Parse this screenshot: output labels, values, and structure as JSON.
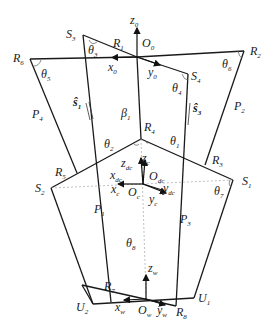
{
  "figure": {
    "type": "mechanism-diagram",
    "labels": {
      "z0": {
        "base": "z",
        "sub": "0"
      },
      "x0": {
        "base": "x",
        "sub": "0"
      },
      "y0": {
        "base": "y",
        "sub": "0"
      },
      "O0": {
        "base": "O",
        "sub": "0"
      },
      "R1": {
        "base": "R",
        "sub": "1"
      },
      "R2": {
        "base": "R",
        "sub": "2"
      },
      "R3": {
        "base": "R",
        "sub": "3"
      },
      "R4": {
        "base": "R",
        "sub": "4"
      },
      "R5": {
        "base": "R",
        "sub": "5"
      },
      "R6": {
        "base": "R",
        "sub": "6"
      },
      "R7": {
        "base": "R",
        "sub": "7"
      },
      "R8": {
        "base": "R",
        "sub": "8"
      },
      "S1": {
        "base": "S",
        "sub": "1"
      },
      "S2": {
        "base": "S",
        "sub": "2"
      },
      "S3": {
        "base": "S",
        "sub": "3"
      },
      "S4": {
        "base": "S",
        "sub": "4"
      },
      "P1": {
        "base": "P",
        "sub": "1"
      },
      "P2": {
        "base": "P",
        "sub": "2"
      },
      "P3": {
        "base": "P",
        "sub": "3"
      },
      "P4": {
        "base": "P",
        "sub": "4"
      },
      "U1": {
        "base": "U",
        "sub": "1"
      },
      "U2": {
        "base": "U",
        "sub": "2"
      },
      "theta1": {
        "base": "θ",
        "sub": "1"
      },
      "theta2": {
        "base": "θ",
        "sub": "2"
      },
      "theta3": {
        "base": "θ",
        "sub": "3"
      },
      "theta4": {
        "base": "θ",
        "sub": "4"
      },
      "theta5": {
        "base": "θ",
        "sub": "5"
      },
      "theta6": {
        "base": "θ",
        "sub": "6"
      },
      "theta7": {
        "base": "θ",
        "sub": "7"
      },
      "theta8": {
        "base": "θ",
        "sub": "8"
      },
      "beta1": {
        "base": "β",
        "sub": "1"
      },
      "s1": {
        "base": "ŝ",
        "sub": "1"
      },
      "s3": {
        "base": "ŝ",
        "sub": "3"
      },
      "zdc": {
        "base": "z",
        "sub": "dc"
      },
      "xdc": {
        "base": "x",
        "sub": "dc"
      },
      "ydc": {
        "base": "y",
        "sub": "dc"
      },
      "Odc": {
        "base": "O",
        "sub": "dc"
      },
      "zc": {
        "base": "z",
        "sub": "c"
      },
      "xc": {
        "base": "x",
        "sub": "c"
      },
      "yc": {
        "base": "y",
        "sub": "c"
      },
      "Oc": {
        "base": "O",
        "sub": "c"
      },
      "zw": {
        "base": "z",
        "sub": "w"
      },
      "xw": {
        "base": "x",
        "sub": "w"
      },
      "yw": {
        "base": "y",
        "sub": "w"
      },
      "Ow": {
        "base": "O",
        "sub": "w"
      }
    },
    "colors": {
      "stroke": "#1a1a1a",
      "dashed": "#b0b0b0",
      "background": "#ffffff"
    }
  }
}
